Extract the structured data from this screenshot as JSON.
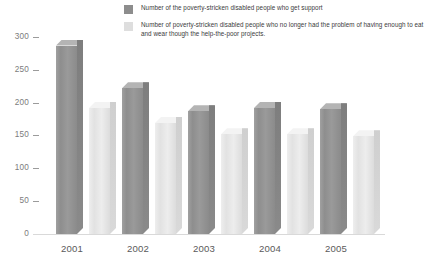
{
  "legend": {
    "items": [
      {
        "swatch": "dark",
        "color": "#8d8d8d",
        "label": "Number of the poverty-stricken disabled people who get support"
      },
      {
        "swatch": "light",
        "color": "#dedede",
        "label": "Number of poverty-stricken disabled people who no longer had the problem of having enough to eat and wear though the help-the-poor projects."
      }
    ]
  },
  "axis": {
    "y_ticks": [
      "300",
      "250",
      "200",
      "150",
      "100",
      "50",
      "0"
    ],
    "x_ticks": [
      "2001",
      "2002",
      "2003",
      "2004",
      "2005"
    ]
  },
  "chart_data": {
    "type": "bar",
    "title": "",
    "xlabel": "",
    "ylabel": "",
    "ylim": [
      0,
      300
    ],
    "yticks": [
      0,
      50,
      100,
      150,
      200,
      250,
      300
    ],
    "grid": false,
    "legend_position": "top",
    "style": "3d-columns-grouped",
    "categories": [
      "2001",
      "2002",
      "2003",
      "2004",
      "2005"
    ],
    "series": [
      {
        "name": "Number of the poverty-stricken disabled people who get support",
        "color": "#8d8d8d",
        "values": [
          287,
          222,
          187,
          192,
          190
        ]
      },
      {
        "name": "Number of poverty-stricken disabled people who no longer had the problem of having enough to eat and wear though the help-the-poor projects.",
        "color": "#dedede",
        "values": [
          192,
          169,
          152,
          152,
          149
        ]
      }
    ]
  }
}
